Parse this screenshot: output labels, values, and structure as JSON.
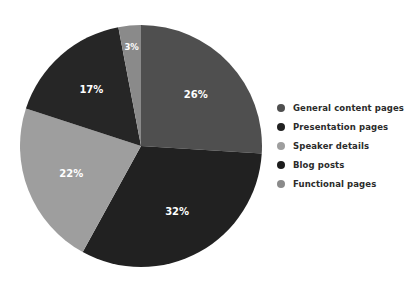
{
  "chart_data": {
    "type": "pie",
    "title": "",
    "subtitle": "",
    "xlabel": "",
    "ylabel": "",
    "grid": false,
    "legend_position": "right",
    "start_angle_deg": 0,
    "direction": "clockwise",
    "categories": [
      "General content pages",
      "Presentation pages",
      "Speaker details",
      "Blog posts",
      "Functional pages"
    ],
    "values": [
      26,
      32,
      22,
      17,
      3
    ],
    "labels": [
      "26%",
      "32%",
      "22%",
      "17%",
      "3%"
    ],
    "colors": [
      "#4f4f4f",
      "#212121",
      "#9e9e9e",
      "#262626",
      "#8a8a8a"
    ],
    "units": "percent"
  },
  "pie": {
    "slices": [
      {
        "name": "General content pages",
        "value": 26,
        "label": "26%",
        "color": "#4f4f4f"
      },
      {
        "name": "Presentation pages",
        "value": 32,
        "label": "32%",
        "color": "#212121"
      },
      {
        "name": "Speaker details",
        "value": 22,
        "label": "22%",
        "color": "#9e9e9e"
      },
      {
        "name": "Blog posts",
        "value": 17,
        "label": "17%",
        "color": "#262626"
      },
      {
        "name": "Functional pages",
        "value": 3,
        "label": "3%",
        "color": "#8a8a8a"
      }
    ],
    "label_color": "#ffffff"
  },
  "legend": {
    "items": [
      {
        "label": "General content pages",
        "color": "#4f4f4f"
      },
      {
        "label": "Presentation pages",
        "color": "#212121"
      },
      {
        "label": "Speaker details",
        "color": "#9e9e9e"
      },
      {
        "label": "Blog posts",
        "color": "#1c1c1c"
      },
      {
        "label": "Functional pages",
        "color": "#8a8a8a"
      }
    ],
    "text_color": "#2b2b2b"
  }
}
